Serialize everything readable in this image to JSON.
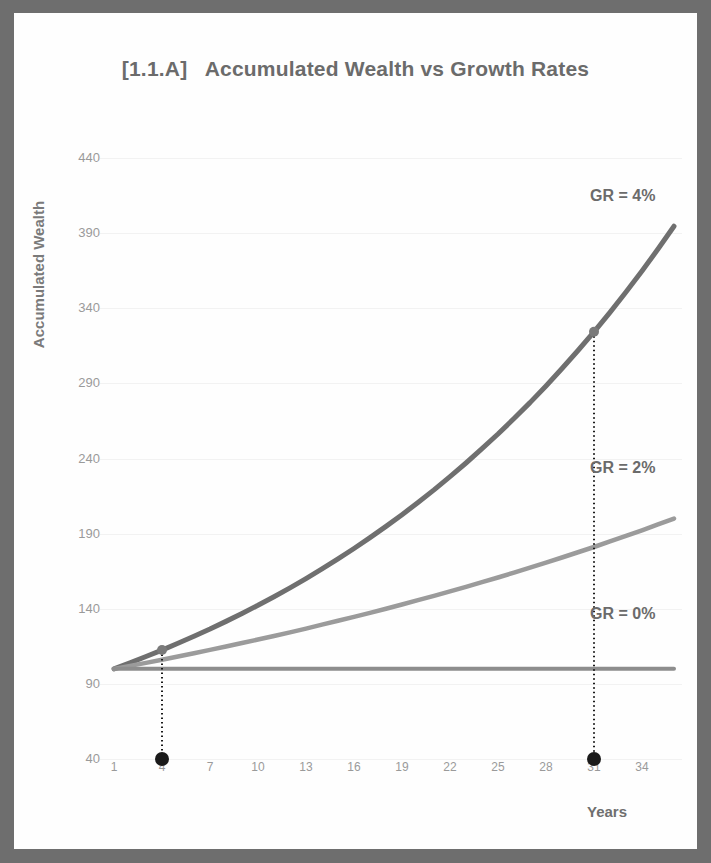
{
  "chart_data": {
    "type": "line",
    "title": "[1.1.A]   Accumulated Wealth vs Growth Rates",
    "xlabel": "Years",
    "ylabel": "Accumulated Wealth",
    "xlim": [
      1,
      36
    ],
    "ylim": [
      40,
      440
    ],
    "grid": true,
    "legend_position": "inline-right",
    "xticks": [
      "1",
      "4",
      "7",
      "10",
      "13",
      "16",
      "19",
      "22",
      "25",
      "28",
      "31",
      "34"
    ],
    "yticks": [
      "440",
      "390",
      "340",
      "290",
      "240",
      "190",
      "140",
      "90",
      "40"
    ],
    "x": [
      1,
      2,
      3,
      4,
      5,
      6,
      7,
      8,
      9,
      10,
      11,
      12,
      13,
      14,
      15,
      16,
      17,
      18,
      19,
      20,
      21,
      22,
      23,
      24,
      25,
      26,
      27,
      28,
      29,
      30,
      31,
      32,
      33,
      34,
      35,
      36
    ],
    "series": [
      {
        "name": "GR = 4%",
        "label": "GR = 4%",
        "color": "#6f6f6f",
        "rate_percent": 4,
        "start_value": 100,
        "values": [
          100,
          104,
          108.2,
          112.5,
          117,
          121.7,
          126.5,
          131.6,
          136.9,
          142.3,
          148,
          153.9,
          160.1,
          166.5,
          173.2,
          180.1,
          187.3,
          194.8,
          202.6,
          210.7,
          219.1,
          227.9,
          237,
          246.5,
          256.3,
          266.6,
          277.2,
          288.3,
          299.9,
          311.9,
          324.3,
          337.3,
          350.8,
          364.8,
          379.4,
          394.6
        ]
      },
      {
        "name": "GR = 2%",
        "label": "GR = 2%",
        "color": "#9b9b9b",
        "rate_percent": 2,
        "start_value": 100,
        "values": [
          100,
          102,
          104,
          106.1,
          108.2,
          110.4,
          112.6,
          114.9,
          117.2,
          119.5,
          121.9,
          124.3,
          126.8,
          129.4,
          132,
          134.6,
          137.3,
          140,
          142.8,
          145.7,
          148.6,
          151.6,
          154.6,
          157.7,
          160.8,
          164.1,
          167.4,
          170.7,
          174.1,
          177.6,
          181.1,
          184.8,
          188.5,
          192.2,
          196.1,
          200
        ]
      },
      {
        "name": "GR = 0%",
        "label": "GR = 0%",
        "color": "#8d8d8d",
        "rate_percent": 0,
        "start_value": 100,
        "values": [
          100,
          100,
          100,
          100,
          100,
          100,
          100,
          100,
          100,
          100,
          100,
          100,
          100,
          100,
          100,
          100,
          100,
          100,
          100,
          100,
          100,
          100,
          100,
          100,
          100,
          100,
          100,
          100,
          100,
          100,
          100,
          100,
          100,
          100,
          100,
          100
        ]
      }
    ],
    "annotations": [
      {
        "name": "marker-year-4",
        "x": 4,
        "y": 112.5,
        "dropline_to": 40,
        "dot_color": "#1a1a1a",
        "line_style": "dotted"
      },
      {
        "name": "marker-year-31",
        "x": 31,
        "y": 324.3,
        "dropline_to": 40,
        "dot_color": "#1a1a1a",
        "line_style": "dotted"
      }
    ]
  },
  "frame": {
    "border_color": "#6e6e6e",
    "background_color": "#fefefe"
  }
}
